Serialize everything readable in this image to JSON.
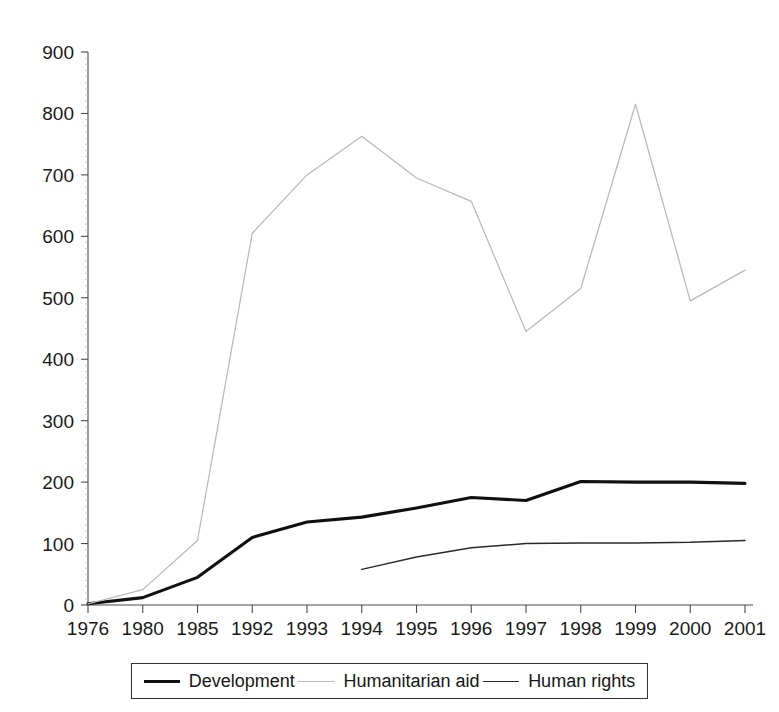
{
  "page": {
    "background_color": "#ffffff",
    "width": 779,
    "height": 712,
    "title_remnant": ""
  },
  "chart_data": {
    "type": "line",
    "title": "",
    "subtitle": "",
    "xlabel": "",
    "ylabel": "",
    "categories": [
      "1976",
      "1980",
      "1985",
      "1992",
      "1993",
      "1994",
      "1995",
      "1996",
      "1997",
      "1998",
      "1999",
      "2000",
      "2001"
    ],
    "x": [
      "1976",
      "1980",
      "1985",
      "1992",
      "1993",
      "1994",
      "1995",
      "1996",
      "1997",
      "1998",
      "1999",
      "2000",
      "2001"
    ],
    "ylim": [
      0,
      900
    ],
    "yticks": [
      0,
      100,
      200,
      300,
      400,
      500,
      600,
      700,
      800,
      900
    ],
    "ytick_labels": [
      "0",
      "100",
      "200",
      "300",
      "400",
      "500",
      "600",
      "700",
      "800",
      "900"
    ],
    "grid": false,
    "legend_position": "bottom",
    "series": [
      {
        "name": "Development",
        "color": "#101010",
        "line_width": 3.1,
        "values": [
          2,
          12,
          45,
          110,
          135,
          143,
          158,
          175,
          170,
          201,
          200,
          200,
          198
        ]
      },
      {
        "name": "Humanitarian aid",
        "color": "#b9b9b9",
        "line_width": 1.25,
        "values": [
          2,
          25,
          105,
          605,
          700,
          763,
          695,
          657,
          445,
          515,
          815,
          495,
          545
        ]
      },
      {
        "name": "Human rights",
        "color": "#2a2a2a",
        "line_width": 1.5,
        "values": [
          null,
          null,
          null,
          null,
          null,
          58,
          78,
          93,
          100,
          101,
          101,
          102,
          105
        ]
      }
    ]
  },
  "legend": {
    "entries": [
      {
        "label": "Development",
        "style": "development"
      },
      {
        "label": "Humanitarian aid",
        "style": "humanitarian"
      },
      {
        "label": "Human rights",
        "style": "humanrights"
      }
    ]
  }
}
